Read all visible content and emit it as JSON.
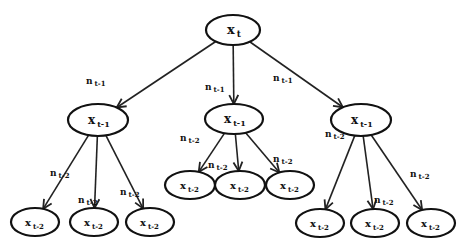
{
  "diagram": {
    "type": "tree",
    "colors": {
      "stroke": "#111111",
      "background": "#ffffff"
    },
    "root": {
      "id": "r",
      "var": "x",
      "sub": "t",
      "cx": 233,
      "cy": 30,
      "rx": 27,
      "ry": 15
    },
    "level1": [
      {
        "id": "a",
        "var": "x",
        "sub": "t-1",
        "cx": 98,
        "cy": 120,
        "rx": 30,
        "ry": 16,
        "edge_label": {
          "var": "n",
          "sub": "t-1",
          "x": 86,
          "y": 84
        }
      },
      {
        "id": "b",
        "var": "x",
        "sub": "t-1",
        "cx": 234,
        "cy": 119,
        "rx": 29,
        "ry": 15,
        "edge_label": {
          "var": "n",
          "sub": "t-1",
          "x": 205,
          "y": 90
        }
      },
      {
        "id": "c",
        "var": "x",
        "sub": "t-1",
        "cx": 361,
        "cy": 120,
        "rx": 30,
        "ry": 16,
        "edge_label": {
          "var": "n",
          "sub": "t-1",
          "x": 273,
          "y": 81
        }
      }
    ],
    "level2": [
      {
        "parent": "a",
        "var": "x",
        "sub": "t-2",
        "cx": 35,
        "cy": 222,
        "rx": 24,
        "ry": 14,
        "edge_label": {
          "var": "n",
          "sub": "t-2",
          "x": 50,
          "y": 176
        }
      },
      {
        "parent": "a",
        "var": "x",
        "sub": "t-2",
        "cx": 94,
        "cy": 222,
        "rx": 24,
        "ry": 14,
        "edge_label": {
          "var": "n",
          "sub": "t-2",
          "x": 78,
          "y": 203
        }
      },
      {
        "parent": "a",
        "var": "x",
        "sub": "t-2",
        "cx": 150,
        "cy": 222,
        "rx": 24,
        "ry": 14,
        "edge_label": {
          "var": "n",
          "sub": "t-2",
          "x": 120,
          "y": 195
        }
      },
      {
        "parent": "b",
        "var": "x",
        "sub": "t-2",
        "cx": 190,
        "cy": 185,
        "rx": 25,
        "ry": 14,
        "edge_label": {
          "var": "n",
          "sub": "t-2",
          "x": 180,
          "y": 141
        }
      },
      {
        "parent": "b",
        "var": "x",
        "sub": "t-2",
        "cx": 240,
        "cy": 185,
        "rx": 25,
        "ry": 14,
        "edge_label": {
          "var": "n",
          "sub": "t-2",
          "x": 208,
          "y": 168
        }
      },
      {
        "parent": "b",
        "var": "x",
        "sub": "t-2",
        "cx": 290,
        "cy": 185,
        "rx": 24,
        "ry": 14,
        "edge_label": {
          "var": "n",
          "sub": "t-2",
          "x": 273,
          "y": 162
        }
      },
      {
        "parent": "c",
        "var": "x",
        "sub": "t-2",
        "cx": 320,
        "cy": 223,
        "rx": 24,
        "ry": 14,
        "edge_label": {
          "var": "n",
          "sub": "t-2",
          "x": 325,
          "y": 137
        }
      },
      {
        "parent": "c",
        "var": "x",
        "sub": "t-2",
        "cx": 375,
        "cy": 223,
        "rx": 24,
        "ry": 14,
        "edge_label": {
          "var": "n",
          "sub": "t-2",
          "x": 374,
          "y": 203
        }
      },
      {
        "parent": "c",
        "var": "x",
        "sub": "t-2",
        "cx": 431,
        "cy": 223,
        "rx": 24,
        "ry": 14,
        "edge_label": {
          "var": "n",
          "sub": "t-2",
          "x": 410,
          "y": 177
        }
      }
    ]
  }
}
